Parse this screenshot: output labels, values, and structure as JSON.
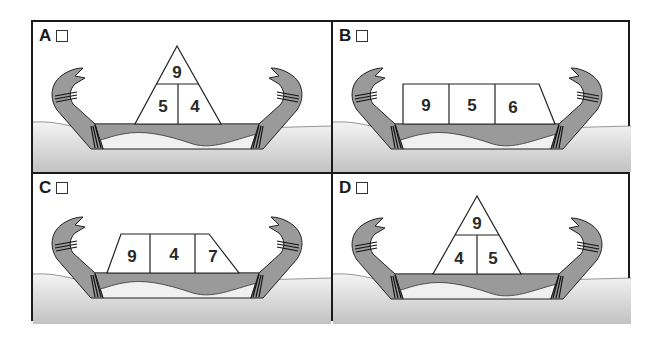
{
  "figure": {
    "colors": {
      "border": "#1a1a1a",
      "hull": "#9a9a9a",
      "water_top": "#f2f2f2",
      "water_bottom": "#c4c4c4",
      "sky": "#ffffff"
    }
  },
  "options": [
    {
      "id": "A",
      "label": "A",
      "shape": "triangle",
      "numbers": {
        "top": "9",
        "left": "5",
        "right": "4"
      }
    },
    {
      "id": "B",
      "label": "B",
      "shape": "right-trapezoid",
      "numbers": {
        "left": "9",
        "middle": "5",
        "right": "6"
      }
    },
    {
      "id": "C",
      "label": "C",
      "shape": "trapezoid",
      "numbers": {
        "left": "9",
        "middle": "4",
        "right": "7"
      }
    },
    {
      "id": "D",
      "label": "D",
      "shape": "triangle",
      "numbers": {
        "top": "9",
        "left": "4",
        "right": "5"
      }
    }
  ]
}
